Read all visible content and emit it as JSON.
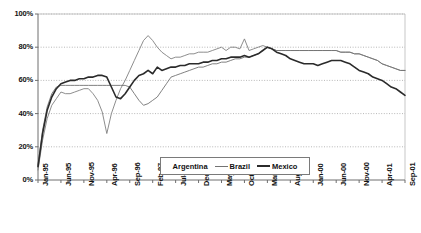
{
  "chart_data": {
    "type": "line",
    "title": "",
    "xlabel": "",
    "ylabel": "",
    "ylim": [
      0,
      100
    ],
    "ytick_labels": [
      "0%",
      "20%",
      "40%",
      "60%",
      "80%",
      "100%"
    ],
    "ytick_values": [
      0,
      20,
      40,
      60,
      80,
      100
    ],
    "grid": true,
    "grid_style": "dotted-horizontal",
    "legend_position": "bottom-center",
    "x_tick_interval_months": 5,
    "tick_labels": [
      "Jan-95",
      "Jun-95",
      "Nov-95",
      "Apr-96",
      "Sep-96",
      "Feb-97",
      "Jul-97",
      "Dec-97",
      "May-98",
      "Oct-98",
      "Mar-99",
      "Aug-99",
      "Jan-00",
      "Jun-00",
      "Nov-00",
      "Apr-01",
      "Sep-01"
    ],
    "x": [
      "Jan-95",
      "Feb-95",
      "Mar-95",
      "Apr-95",
      "May-95",
      "Jun-95",
      "Jul-95",
      "Aug-95",
      "Sep-95",
      "Oct-95",
      "Nov-95",
      "Dec-95",
      "Jan-96",
      "Feb-96",
      "Mar-96",
      "Apr-96",
      "May-96",
      "Jun-96",
      "Jul-96",
      "Aug-96",
      "Sep-96",
      "Oct-96",
      "Nov-96",
      "Dec-96",
      "Jan-97",
      "Feb-97",
      "Mar-97",
      "Apr-97",
      "May-97",
      "Jun-97",
      "Jul-97",
      "Aug-97",
      "Sep-97",
      "Oct-97",
      "Nov-97",
      "Dec-97",
      "Jan-98",
      "Feb-98",
      "Mar-98",
      "Apr-98",
      "May-98",
      "Jun-98",
      "Jul-98",
      "Aug-98",
      "Sep-98",
      "Oct-98",
      "Nov-98",
      "Dec-98",
      "Jan-99",
      "Feb-99",
      "Mar-99",
      "Apr-99",
      "May-99",
      "Jun-99",
      "Jul-99",
      "Aug-99",
      "Sep-99",
      "Oct-99",
      "Nov-99",
      "Dec-99",
      "Jan-00",
      "Feb-00",
      "Mar-00",
      "Apr-00",
      "May-00",
      "Jun-00",
      "Jul-00",
      "Aug-00",
      "Sep-00",
      "Oct-00",
      "Nov-00",
      "Dec-00",
      "Jan-01",
      "Feb-01",
      "Mar-01",
      "Apr-01",
      "May-01",
      "Jun-01",
      "Jul-01",
      "Aug-01",
      "Sep-01"
    ],
    "series": [
      {
        "name": "Argentina",
        "color": "#808080",
        "width": 0.9,
        "values": [
          6,
          24,
          37,
          45,
          49,
          53,
          52,
          52,
          53,
          54,
          55,
          55,
          52,
          48,
          41,
          28,
          40,
          48,
          55,
          60,
          66,
          72,
          78,
          84,
          87,
          84,
          80,
          77,
          75,
          73,
          74,
          74,
          75,
          76,
          76,
          77,
          77,
          77,
          78,
          79,
          80,
          78,
          80,
          80,
          79,
          85,
          78,
          79,
          80,
          81,
          80,
          79,
          78,
          78,
          78,
          78,
          78,
          78,
          78,
          78,
          78,
          78,
          78,
          78,
          78,
          78,
          77,
          77,
          77,
          76,
          76,
          75,
          74,
          73,
          72,
          70,
          69,
          68,
          67,
          66,
          66
        ]
      },
      {
        "name": "Brazil",
        "color": "#737373",
        "width": 0.9,
        "values": [
          9,
          30,
          44,
          52,
          56,
          57,
          57,
          57,
          57,
          57,
          57,
          57,
          57,
          57,
          57,
          57,
          57,
          57,
          57,
          57,
          56,
          52,
          48,
          45,
          46,
          48,
          50,
          54,
          58,
          62,
          63,
          64,
          65,
          66,
          67,
          68,
          68,
          69,
          70,
          70,
          71,
          71,
          72,
          73,
          73,
          74,
          74,
          75,
          76,
          78,
          80,
          79,
          78,
          78,
          78,
          78,
          78,
          78,
          78,
          78,
          78,
          78,
          78,
          78,
          78,
          78,
          77,
          77,
          77,
          76,
          76,
          75,
          74,
          73,
          72,
          70,
          69,
          68,
          67,
          66,
          66
        ]
      },
      {
        "name": "Mexico",
        "color": "#2b2b2b",
        "width": 1.6,
        "values": [
          8,
          28,
          42,
          50,
          55,
          58,
          59,
          60,
          60,
          61,
          61,
          62,
          62,
          63,
          63,
          62,
          56,
          50,
          49,
          52,
          56,
          60,
          63,
          64,
          66,
          64,
          68,
          66,
          67,
          68,
          68,
          69,
          69,
          70,
          70,
          70,
          71,
          71,
          72,
          72,
          73,
          73,
          74,
          74,
          74,
          75,
          74,
          75,
          76,
          78,
          80,
          79,
          77,
          76,
          75,
          73,
          72,
          71,
          70,
          70,
          70,
          69,
          70,
          71,
          72,
          72,
          72,
          71,
          70,
          68,
          66,
          65,
          64,
          62,
          61,
          60,
          58,
          56,
          55,
          53,
          51
        ]
      }
    ]
  },
  "legend": {
    "items": [
      {
        "label": "Argentina"
      },
      {
        "label": "Brazil"
      },
      {
        "label": "Mexico"
      }
    ]
  }
}
